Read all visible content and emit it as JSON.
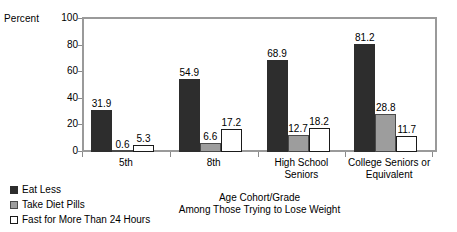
{
  "chart_data": {
    "type": "bar",
    "title": "",
    "xlabel": "Age Cohort/Grade",
    "xsublabel": "Among Those Trying to Lose Weight",
    "ylabel": "Percent",
    "ylim": [
      0,
      100
    ],
    "yticks": [
      0,
      20,
      40,
      60,
      80,
      100
    ],
    "grid": false,
    "legend_position": "bottom-left",
    "categories": [
      "5th",
      "8th",
      "High School Seniors",
      "College Seniors or Equivalent"
    ],
    "category_lines": [
      [
        "5th"
      ],
      [
        "8th"
      ],
      [
        "High School",
        "Seniors"
      ],
      [
        "College Seniors or",
        "Equivalent"
      ]
    ],
    "series": [
      {
        "name": "Eat Less",
        "color": "#2d2d2d",
        "values": [
          31.9,
          54.9,
          68.9,
          81.2
        ],
        "labels": [
          "31.9",
          "54.9",
          "68.9",
          "81.2"
        ]
      },
      {
        "name": "Take Diet Pills",
        "color": "#9d9d9d",
        "values": [
          0.6,
          6.6,
          12.7,
          28.8
        ],
        "labels": [
          "0.6",
          "6.6",
          "12.7",
          "28.8"
        ]
      },
      {
        "name": "Fast for More Than 24 Hours",
        "color": "#ffffff",
        "values": [
          5.3,
          17.2,
          18.2,
          11.7
        ],
        "labels": [
          "5.3",
          "17.2",
          "18.2",
          "11.7"
        ]
      }
    ]
  }
}
